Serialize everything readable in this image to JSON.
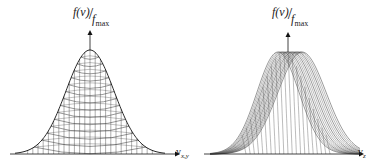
{
  "panels": [
    {
      "id": "left",
      "y_label": {
        "num": "f(v)",
        "den": "f",
        "den_sub": "max"
      },
      "x_label": {
        "main": "v",
        "sub": "x,y"
      },
      "style": "symmetric gaussian mesh"
    },
    {
      "id": "right",
      "y_label": {
        "num": "f(v)",
        "den": "f",
        "den_sub": "max"
      },
      "x_label": {
        "main": "v",
        "sub": "z"
      },
      "style": "shifted/sheared gaussian mesh"
    }
  ]
}
